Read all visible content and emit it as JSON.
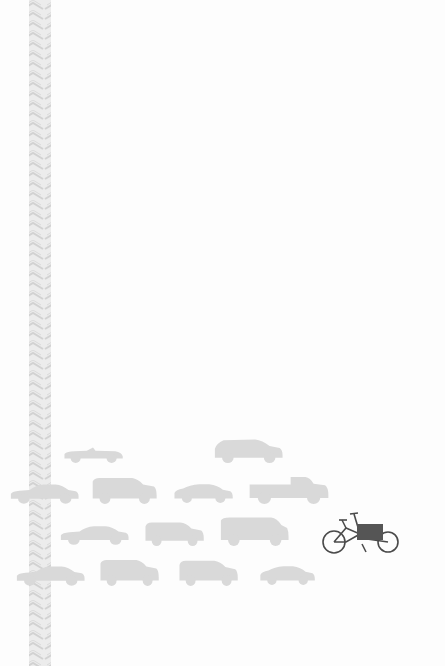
{
  "colors": {
    "background": "#fdfdfd",
    "car": "#d9d9d9",
    "car_window": "#e6e6e6",
    "tire_track": "#d6d6d6",
    "bike_frame": "#4a4a4a",
    "bike_box": "#555555"
  },
  "tire_track": {
    "x": 29,
    "width": 22,
    "height": 666
  },
  "cars": [
    {
      "type": "convertible",
      "x": 62,
      "y": 442,
      "w": 62,
      "h": 22
    },
    {
      "type": "hatchback",
      "x": 212,
      "y": 437,
      "w": 72,
      "h": 26
    },
    {
      "type": "sedan",
      "x": 8,
      "y": 480,
      "w": 72,
      "h": 25
    },
    {
      "type": "suv",
      "x": 90,
      "y": 476,
      "w": 68,
      "h": 28
    },
    {
      "type": "compact",
      "x": 172,
      "y": 482,
      "w": 62,
      "h": 22
    },
    {
      "type": "pickup",
      "x": 248,
      "y": 474,
      "w": 82,
      "h": 30
    },
    {
      "type": "sedan",
      "x": 58,
      "y": 522,
      "w": 72,
      "h": 24
    },
    {
      "type": "minivan",
      "x": 143,
      "y": 520,
      "w": 62,
      "h": 26
    },
    {
      "type": "van",
      "x": 218,
      "y": 516,
      "w": 72,
      "h": 30
    },
    {
      "type": "sedan",
      "x": 14,
      "y": 562,
      "w": 72,
      "h": 25
    },
    {
      "type": "suv",
      "x": 98,
      "y": 558,
      "w": 62,
      "h": 28
    },
    {
      "type": "minivan",
      "x": 177,
      "y": 558,
      "w": 62,
      "h": 28
    },
    {
      "type": "compact",
      "x": 258,
      "y": 564,
      "w": 58,
      "h": 22
    }
  ],
  "cargo_bike": {
    "x": 320,
    "y": 512,
    "w": 80,
    "h": 42
  }
}
